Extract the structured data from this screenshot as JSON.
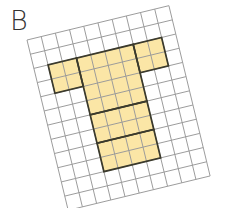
{
  "figure": {
    "label": "B",
    "grid": {
      "columns": 10,
      "rows": 12,
      "cell_size": 14.6,
      "rotation_deg": -13.6,
      "origin": [
        27,
        40
      ],
      "line_color": "#9a9a9a",
      "background": "#ffffff"
    },
    "shape": {
      "description": "T-shaped figure made of outlined rectangular blocks",
      "fill_color": "#fbe6a6",
      "outline_color": "#3b3a2c",
      "blocks": [
        {
          "name": "top-left-block",
          "col": 1,
          "row": 2,
          "w": 2,
          "h": 2
        },
        {
          "name": "top-center-block",
          "col": 3,
          "row": 2,
          "w": 4,
          "h": 4
        },
        {
          "name": "top-right-block",
          "col": 7,
          "row": 2,
          "w": 2,
          "h": 2
        },
        {
          "name": "stem-middle-block",
          "col": 3,
          "row": 6,
          "w": 4,
          "h": 2
        },
        {
          "name": "stem-bottom-block",
          "col": 3,
          "row": 8,
          "w": 4,
          "h": 2
        }
      ]
    }
  }
}
